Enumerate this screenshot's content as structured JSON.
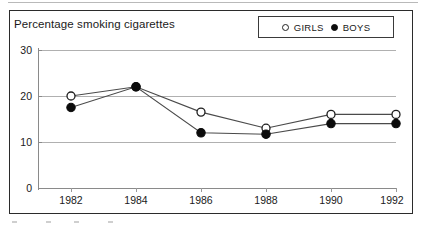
{
  "chart": {
    "title": "Percentage smoking cigarettes",
    "legend": [
      {
        "label": "GIRLS",
        "marker": "open-circle-icon"
      },
      {
        "label": "BOYS",
        "marker": "filled-circle-icon"
      }
    ]
  },
  "chart_data": {
    "type": "line",
    "title": "Percentage smoking cigarettes",
    "xlabel": "",
    "ylabel": "",
    "categories": [
      "1982",
      "1984",
      "1986",
      "1988",
      "1990",
      "1992"
    ],
    "series": [
      {
        "name": "GIRLS",
        "marker": "open circle",
        "values": [
          20,
          22,
          16.5,
          13,
          16,
          16
        ]
      },
      {
        "name": "BOYS",
        "marker": "filled circle",
        "values": [
          17.5,
          22,
          12,
          11.7,
          14,
          14
        ]
      }
    ],
    "ylim": [
      0,
      30
    ],
    "yticks": [
      0,
      10,
      20,
      30
    ],
    "ytick_labels": [
      "0",
      "10",
      "20",
      "30"
    ],
    "grid": true,
    "legend_position": "top-right"
  }
}
